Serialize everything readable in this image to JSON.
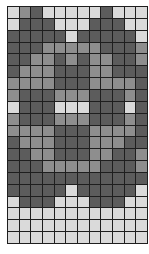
{
  "grid": {
    "columns": 12,
    "rows": 20,
    "palette": {
      "L": "#dadada",
      "M": "#8e8e8e",
      "D": "#5c5c5c",
      "line": "#1e1e1e"
    },
    "cells": [
      "LMDLLLLLDLLL",
      "LDDDLLLDDDLL",
      "DDDDDLDDDDDL",
      "DDDMMMMMDDDM",
      "DDMMDMDMMDDM",
      "DMMMDDDMMDDD",
      "MMMMDDDMMMMD",
      "MDDDMMMDDDMD",
      "LDDDLLLDDDLD",
      "MDDDMMMDDDMD",
      "MMMMDDDMMMMD",
      "DMMMDDDMMMDD",
      "DDMMDDDMMDDM",
      "DDDMMMMMDDDM",
      "DDDDDDDDDDDD",
      "DDDDDLDDDDDL",
      "LDDDLLLDDDLL",
      "LLLLLLLLLLLL",
      "LLLLLLLLLLLL",
      "LLLLLLLLLLLL"
    ]
  }
}
